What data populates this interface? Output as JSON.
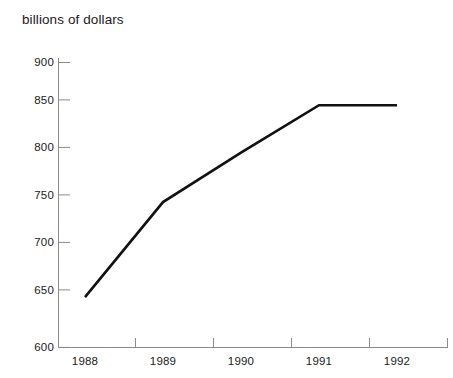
{
  "chart_data": {
    "type": "line",
    "title": "billions of dollars",
    "xlabel": "",
    "ylabel": "",
    "categories": [
      "1988",
      "1989",
      "1990",
      "1991",
      "1992"
    ],
    "x": [
      1988,
      1989,
      1990,
      1991,
      1992
    ],
    "values": [
      653,
      753,
      805,
      855,
      855
    ],
    "series": [
      {
        "name": "billions of dollars",
        "values": [
          653,
          753,
          805,
          855,
          855
        ]
      }
    ],
    "ylim": [
      600,
      900
    ],
    "yticks": [
      600,
      650,
      700,
      750,
      800,
      850,
      900
    ],
    "ytick_labels": [
      "600",
      "650",
      "700",
      "750",
      "800",
      "850",
      "900"
    ],
    "xticks": [
      1988,
      1989,
      1990,
      1991,
      1992
    ],
    "xtick_labels": [
      "1988",
      "1989",
      "1990",
      "1991",
      "1992"
    ],
    "grid": false,
    "legend": false,
    "line_color": "#111111",
    "axis_color": "#8a8a8a",
    "background_color": "#ffffff"
  }
}
